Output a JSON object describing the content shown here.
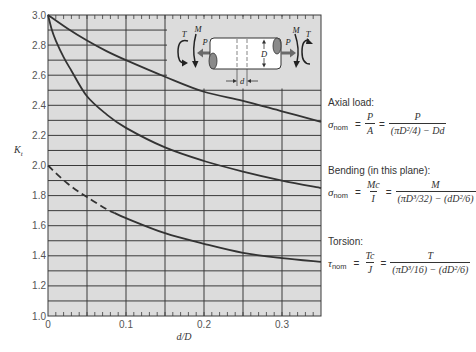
{
  "chart_data": {
    "type": "line",
    "title": "",
    "xlabel": "d/D",
    "ylabel": "Kt",
    "ylabel_parts": [
      "K",
      "t"
    ],
    "xlim": [
      0,
      0.35
    ],
    "ylim": [
      1.0,
      3.0
    ],
    "xticks": [
      0,
      0.1,
      0.2,
      0.3
    ],
    "xtick_labels": [
      "0",
      "0.1",
      "0.2",
      "0.3"
    ],
    "yticks": [
      1.0,
      1.2,
      1.4,
      1.6,
      1.8,
      2.0,
      2.2,
      2.4,
      2.6,
      2.8,
      3.0
    ],
    "ytick_labels": [
      "1.0",
      "1.2",
      "1.4",
      "1.6",
      "1.8",
      "2.0",
      "2.2",
      "2.4",
      "2.6",
      "2.8",
      "3.0"
    ],
    "grid": {
      "on": true,
      "x_major_step": 0.05,
      "y_major_step": 0.1,
      "x_minor_tick_step": 0.01
    },
    "legend": {
      "position": "right",
      "style": "text annotations with formulas"
    },
    "colors": {
      "plot_background": "#dcdcdc",
      "grid": "#3a3a3a",
      "curve": "#333333"
    },
    "series": [
      {
        "name": "Axial load",
        "style": "solid",
        "x": [
          0,
          0.025,
          0.05,
          0.075,
          0.1,
          0.15,
          0.2,
          0.25,
          0.3,
          0.35
        ],
        "y": [
          3.0,
          2.91,
          2.83,
          2.76,
          2.7,
          2.59,
          2.49,
          2.43,
          2.36,
          2.29
        ]
      },
      {
        "name": "Bending (in this plane)",
        "style": "solid",
        "x": [
          0,
          0.005,
          0.01,
          0.02,
          0.03,
          0.05,
          0.075,
          0.1,
          0.15,
          0.2,
          0.25,
          0.3,
          0.35
        ],
        "y": [
          3.0,
          2.9,
          2.83,
          2.72,
          2.63,
          2.46,
          2.34,
          2.25,
          2.12,
          2.03,
          1.96,
          1.9,
          1.85
        ]
      },
      {
        "name": "Torsion",
        "style": "dashed-then-solid",
        "dashed_until": 0.085,
        "x": [
          0,
          0.025,
          0.05,
          0.075,
          0.085,
          0.1,
          0.15,
          0.2,
          0.25,
          0.3,
          0.35
        ],
        "y": [
          2.0,
          1.88,
          1.79,
          1.71,
          1.685,
          1.65,
          1.55,
          1.48,
          1.42,
          1.385,
          1.36
        ]
      }
    ]
  },
  "inset": {
    "labels": {
      "left_torque": "T",
      "left_moment": "M",
      "left_force": "P",
      "right_torque": "T",
      "right_moment": "M",
      "right_force": "P",
      "diameter": "D",
      "hole_diameter": "d"
    }
  },
  "formulas": {
    "axial": {
      "label": "Axial load:",
      "lhs_symbol": "σ",
      "lhs_sub": "nom",
      "eq": "=",
      "frac1_num": "P",
      "frac1_den": "A",
      "frac2_num": "P",
      "frac2_den": "(πD²/4) − Dd"
    },
    "bending": {
      "label": "Bending (in this plane):",
      "lhs_symbol": "σ",
      "lhs_sub": "nom",
      "eq": "=",
      "frac1_num": "Mc",
      "frac1_den": "I",
      "frac2_num": "M",
      "frac2_den": "(πD³/32) − (dD²/6)"
    },
    "torsion": {
      "label": "Torsion:",
      "lhs_symbol": "τ",
      "lhs_sub": "nom",
      "eq": "=",
      "frac1_num": "Tc",
      "frac1_den": "J",
      "frac2_num": "T",
      "frac2_den": "(πD³/16) − (dD²/6)"
    }
  }
}
